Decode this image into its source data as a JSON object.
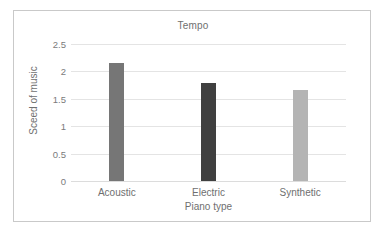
{
  "chart_data": {
    "type": "bar",
    "title": "Tempo",
    "xlabel": "Piano type",
    "ylabel": "Sceed of music",
    "categories": [
      "Acoustic",
      "Electric",
      "Synthetic"
    ],
    "values": [
      2.15,
      1.79,
      1.66
    ],
    "ylim": [
      0,
      2.5
    ],
    "yticks": [
      "0",
      "0.5",
      "1",
      "1.5",
      "2",
      "2.5"
    ],
    "ytick_values": [
      0,
      0.5,
      1,
      1.5,
      2,
      2.5
    ],
    "grid": true,
    "legend": "none",
    "bar_colors": [
      "#767676",
      "#404040",
      "#b4b4b4"
    ],
    "grid_color": "#e4e4e4",
    "axis_text_color": "#6f6f6f",
    "frame_color": "#c9c9c9",
    "background": "#ffffff"
  }
}
